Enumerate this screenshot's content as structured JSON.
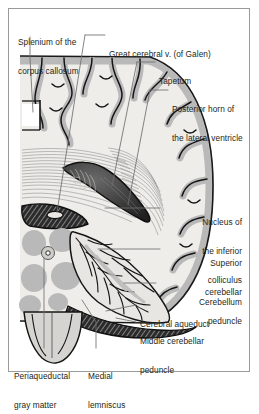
{
  "figure": {
    "kind": "anatomical-illustration",
    "frame_color": "#9a9a9a",
    "background_color": "#ffffff",
    "ink_color": "#231f20",
    "gray_matter_color": "#b9b9b9",
    "white_matter_color": "#eceae7",
    "ventricle_color": "#3a3a3a",
    "leader_line_color": "#6f6f6f"
  },
  "labels": [
    {
      "id": "splenium",
      "line1": "Splenium of the",
      "line2": "corpus callosum",
      "align": "left"
    },
    {
      "id": "great-cerebral-vein",
      "line1": "Great cerebral v. (of Galen)",
      "line2": "",
      "align": "left"
    },
    {
      "id": "tapetum",
      "line1": "Tapetum",
      "line2": "",
      "align": "left"
    },
    {
      "id": "posterior-horn",
      "line1": "Posterior horn of",
      "line2": "the lateral ventricle",
      "align": "left"
    },
    {
      "id": "inferior-colliculus",
      "line1": "Nucleus of",
      "line2": "the inferior",
      "line3": "colliculus",
      "align": "right"
    },
    {
      "id": "superior-cerebellar-peduncle",
      "line1": "Superior",
      "line2": "cerebellar",
      "line3": "peduncle",
      "align": "right"
    },
    {
      "id": "cerebellum",
      "line1": "Cerebellum",
      "line2": "",
      "align": "right"
    },
    {
      "id": "cerebral-aqueduct",
      "line1": "Cerebral aqueduct",
      "line2": "",
      "align": "left"
    },
    {
      "id": "middle-cerebellar-peduncle",
      "line1": "Middle cerebellar",
      "line2": "peduncle",
      "align": "left"
    },
    {
      "id": "periaqueductal-gray",
      "line1": "Periaqueductal",
      "line2": "gray matter",
      "align": "left"
    },
    {
      "id": "medial-lemniscus",
      "line1": "Medial",
      "line2": "lemniscus",
      "align": "left"
    }
  ]
}
